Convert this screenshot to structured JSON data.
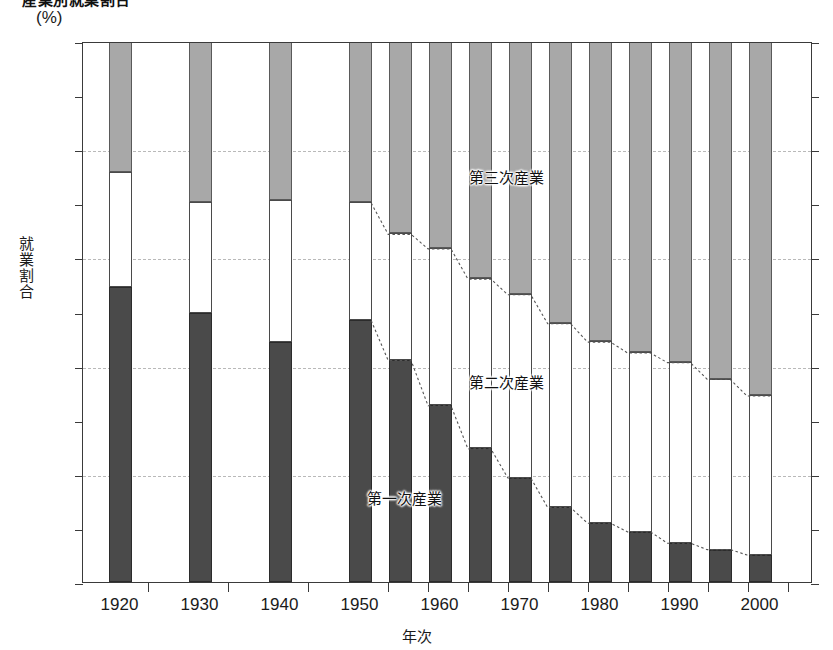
{
  "title": "産業別就業割合",
  "unit_label": "(%)",
  "yaxis": {
    "title_chars": [
      "就",
      "業",
      "割",
      "合"
    ],
    "labels": [
      "100",
      "80",
      "60",
      "40",
      "20",
      "0"
    ],
    "ticks": [
      0,
      10,
      20,
      30,
      40,
      50,
      60,
      70,
      80,
      90,
      100
    ],
    "min": 0,
    "max": 100
  },
  "xaxis": {
    "title": "年次",
    "labels": [
      "1920",
      "1930",
      "1940",
      "1950",
      "1960",
      "1970",
      "1980",
      "1990",
      "2000"
    ]
  },
  "annotations": [
    {
      "text": "第三次産業",
      "x_pct": 58.0,
      "y_pct": 75.5
    },
    {
      "text": "第二次産業",
      "x_pct": 58.0,
      "y_pct": 37.5
    },
    {
      "text": "第一次産業",
      "x_pct": 44.0,
      "y_pct": 16.0
    }
  ],
  "colors": {
    "primary": "#4a4a4a",
    "secondary": "#ffffff",
    "tertiary": "#a8a8a8",
    "frame": "#3a3a3a",
    "grid": "#b9b9b9",
    "text": "#1a1a1a"
  },
  "chart_data": {
    "type": "bar",
    "stacked": true,
    "title": "産業別就業割合",
    "xlabel": "年次",
    "ylabel": "就業割合",
    "unit": "%",
    "ylim": [
      0,
      100
    ],
    "grid": true,
    "legend": "in-plot annotations",
    "categories": [
      "1920",
      "1925",
      "1930",
      "1935",
      "1940",
      "1945",
      "1950",
      "1955",
      "1960",
      "1965",
      "1970",
      "1975",
      "1980",
      "1985",
      "1990",
      "1995",
      "2000"
    ],
    "series": [
      {
        "name": "第一次産業",
        "values": [
          54.6,
          null,
          49.7,
          null,
          44.3,
          null,
          48.5,
          41.1,
          32.7,
          24.7,
          19.3,
          13.8,
          10.9,
          9.3,
          7.2,
          6.0,
          5.0
        ]
      },
      {
        "name": "第二次産業",
        "values": [
          21.2,
          null,
          20.5,
          null,
          26.3,
          null,
          21.8,
          23.4,
          29.1,
          31.5,
          34.0,
          34.1,
          33.6,
          33.2,
          33.5,
          31.6,
          29.5
        ]
      },
      {
        "name": "第三次産業",
        "values": [
          24.2,
          null,
          29.8,
          null,
          29.4,
          null,
          29.7,
          35.5,
          38.2,
          43.8,
          46.7,
          52.1,
          55.5,
          57.5,
          59.3,
          62.4,
          65.5
        ]
      }
    ],
    "bars": [
      {
        "year": "1920",
        "x_px": 108,
        "primary": 54.6,
        "secondary": 21.2,
        "tertiary": 24.2
      },
      {
        "year": "1930",
        "x_px": 188,
        "primary": 49.7,
        "secondary": 20.5,
        "tertiary": 29.8
      },
      {
        "year": "1940",
        "x_px": 268,
        "primary": 44.3,
        "secondary": 26.3,
        "tertiary": 29.4
      },
      {
        "year": "1950",
        "x_px": 348,
        "primary": 48.5,
        "secondary": 21.8,
        "tertiary": 29.7
      },
      {
        "year": "1955",
        "x_px": 388,
        "primary": 41.1,
        "secondary": 23.4,
        "tertiary": 35.5
      },
      {
        "year": "1960",
        "x_px": 428,
        "primary": 32.7,
        "secondary": 29.1,
        "tertiary": 38.2
      },
      {
        "year": "1965",
        "x_px": 468,
        "primary": 24.7,
        "secondary": 31.5,
        "tertiary": 43.8
      },
      {
        "year": "1970",
        "x_px": 508,
        "primary": 19.3,
        "secondary": 34.0,
        "tertiary": 46.7
      },
      {
        "year": "1975",
        "x_px": 548,
        "primary": 13.8,
        "secondary": 34.1,
        "tertiary": 52.1
      },
      {
        "year": "1980",
        "x_px": 588,
        "primary": 10.9,
        "secondary": 33.6,
        "tertiary": 55.5
      },
      {
        "year": "1985",
        "x_px": 628,
        "primary": 9.3,
        "secondary": 33.2,
        "tertiary": 57.5
      },
      {
        "year": "1990",
        "x_px": 668,
        "primary": 7.2,
        "secondary": 33.5,
        "tertiary": 59.3
      },
      {
        "year": "1995",
        "x_px": 708,
        "primary": 6.0,
        "secondary": 31.6,
        "tertiary": 62.4
      },
      {
        "year": "2000",
        "x_px": 748,
        "primary": 5.0,
        "secondary": 29.5,
        "tertiary": 65.5
      }
    ],
    "bar_width_px": 23
  }
}
